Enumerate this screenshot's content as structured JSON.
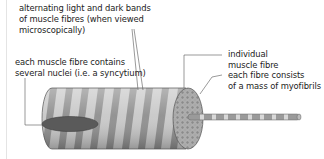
{
  "diagram": {
    "labels": {
      "bands": [
        "alternating light and dark bands",
        "of muscle fibres (when viewed",
        "microscopically)"
      ],
      "nuclei": [
        "each muscle fibre contains",
        "several nuclei (i.e. a syncytium)"
      ],
      "fibre": [
        "individual",
        "muscle fibre"
      ],
      "myofibrils": [
        "each fibre consists",
        "of a mass of myofibrils"
      ]
    },
    "colors": {
      "light_band": "#c8c8c8",
      "dark_band": "#8e8e8e",
      "nucleus": "#5a5a5a",
      "end_face": "#9a9a9a",
      "line": "#555555"
    }
  }
}
